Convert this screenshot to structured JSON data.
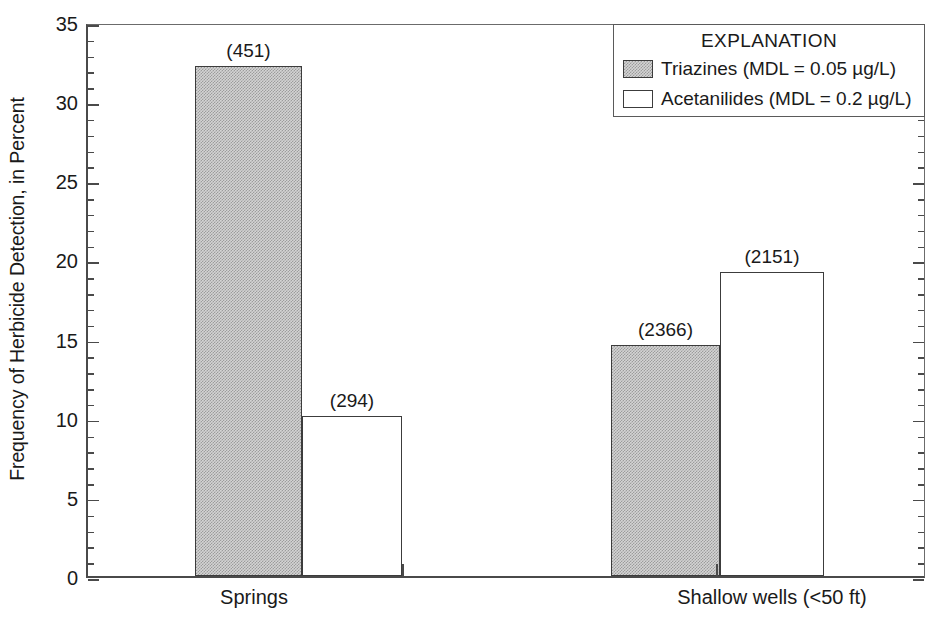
{
  "chart_data": {
    "type": "bar",
    "title": "",
    "xlabel": "",
    "ylabel": "Frequency of Herbicide Detection, in Percent",
    "ylim": [
      0,
      35
    ],
    "ytick_labels": [
      "0",
      "5",
      "10",
      "15",
      "20",
      "25",
      "30",
      "35"
    ],
    "ytick_values": [
      0,
      5,
      10,
      15,
      20,
      25,
      30,
      35
    ],
    "ytick_minor_step": 1,
    "grid": false,
    "legend_position": "top-right",
    "categories": [
      "Springs",
      "Shallow wells (<50 ft)"
    ],
    "series": [
      {
        "name": "Triazines (MDL = 0.05 µg/L)",
        "fill": "gray-stipple",
        "values": [
          32.2,
          14.6
        ],
        "point_labels": [
          "(451)",
          "(2366)"
        ]
      },
      {
        "name": "Acetanilides (MDL = 0.2 µg/L)",
        "fill": "white",
        "values": [
          10.1,
          19.2
        ],
        "point_labels": [
          "(294)",
          "(2151)"
        ]
      }
    ],
    "annotations": [
      "(451)",
      "(294)",
      "(2366)",
      "(2151)"
    ]
  },
  "legend": {
    "title": "EXPLANATION",
    "entries": [
      {
        "label": "Triazines (MDL = 0.05 µg/L)",
        "swatch": "gray-stipple"
      },
      {
        "label": "Acetanilides (MDL = 0.2 µg/L)",
        "swatch": "white"
      }
    ]
  },
  "axis": {
    "y_title": "Frequency of Herbicide Detection, in Percent",
    "y_labels": [
      "35",
      "30",
      "25",
      "20",
      "15",
      "10",
      "5",
      "0"
    ],
    "x_labels": [
      "Springs",
      "Shallow wells (<50 ft)"
    ]
  },
  "colors": {
    "bar_gray": "#d4d4d4",
    "bar_white": "#ffffff",
    "axis": "#4a4a4a",
    "text": "#1a1a1a"
  }
}
